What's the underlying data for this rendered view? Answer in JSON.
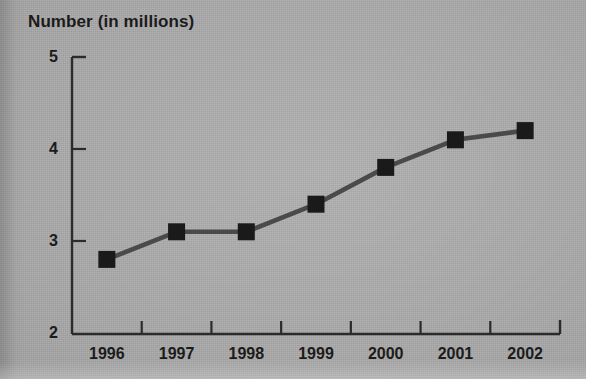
{
  "chart_data": {
    "type": "line",
    "title": "Number (in millions)",
    "xlabel": "",
    "ylabel": "Number (in millions)",
    "categories": [
      "1996",
      "1997",
      "1998",
      "1999",
      "2000",
      "2001",
      "2002"
    ],
    "values": [
      2.8,
      3.1,
      3.1,
      3.4,
      3.8,
      4.1,
      4.2
    ],
    "series": [
      {
        "name": "Number (in millions)",
        "values": [
          2.8,
          3.1,
          3.1,
          3.4,
          3.8,
          4.1,
          4.2
        ]
      }
    ],
    "ylim": [
      2,
      5
    ],
    "ytick_labels": [
      "5",
      "4",
      "3",
      "2"
    ],
    "ytick_values": [
      5,
      4,
      3,
      2
    ],
    "xtick_labels": [
      "1996",
      "1997",
      "1998",
      "1999",
      "2000",
      "2001",
      "2002"
    ],
    "grid": false,
    "legend": "none",
    "marker": "square",
    "colors": {
      "background": "#a9a9a9",
      "line": "#4a4a4a",
      "marker": "#1a1a1a",
      "axis": "#2b2b2b",
      "text": "#1b1b1b"
    }
  }
}
